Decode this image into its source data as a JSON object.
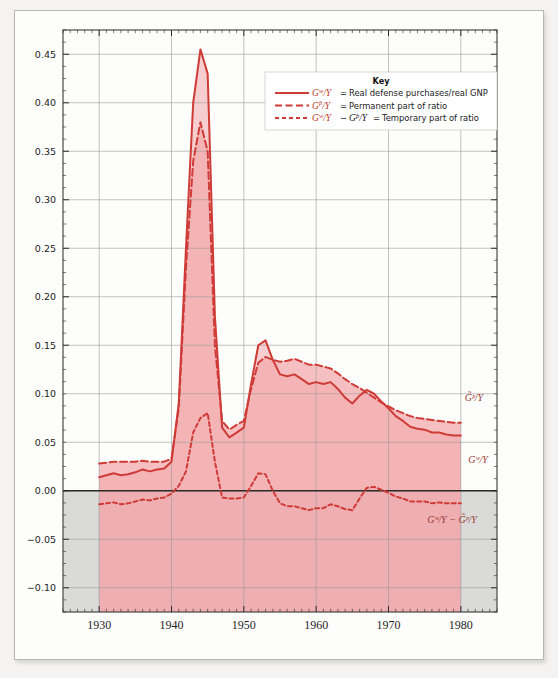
{
  "figure": {
    "background_color": "#f4f3f1",
    "paper_color": "#fdfdfb",
    "accent_color": "#cf3b37",
    "fill_color": "#f2a8ac",
    "negative_band_color": "#d4d4d2"
  },
  "key": {
    "title": "Key",
    "entries": [
      {
        "symbol": "G",
        "sup": "w",
        "denom": "/Y",
        "style": "solid",
        "eq": "=",
        "label": "Real defense purchases/real GNP"
      },
      {
        "symbol": "G",
        "sup": "p",
        "denom": "/Y",
        "style": "dashed",
        "eq": "=",
        "label": "Permanent part of ratio"
      },
      {
        "symbol": "G",
        "sup": "w",
        "denom": "/Y",
        "style": "dotted",
        "eq": "−",
        "symbol2": "G",
        "sup2": "p",
        "denom2": "/Y",
        "eq2": "=",
        "label": "Temporary part of ratio"
      }
    ]
  },
  "annotations": [
    {
      "name": "permanent-curve-label",
      "text": "G̃ᵖ/Y",
      "x": 474,
      "y": 401
    },
    {
      "name": "actual-curve-label",
      "text": "Gʷ/Y",
      "x": 478,
      "y": 463
    },
    {
      "name": "temporary-curve-label",
      "text": "Gʷ/Y − G̃ᵖ/Y",
      "x": 452,
      "y": 523
    }
  ],
  "chart_data": {
    "type": "line",
    "title": "",
    "xlabel": "",
    "ylabel": "",
    "xlim": [
      1925,
      1985
    ],
    "ylim": [
      -0.125,
      0.475
    ],
    "grid": true,
    "legend_position": "upper-right-inset",
    "xticks": [
      1930,
      1940,
      1950,
      1960,
      1970,
      1980
    ],
    "yticks": [
      -0.1,
      -0.05,
      0.0,
      0.05,
      0.1,
      0.15,
      0.2,
      0.25,
      0.3,
      0.35,
      0.4,
      0.45
    ],
    "ytick_labels": [
      "-0.10",
      "-0.05",
      "0.00",
      "0.05",
      "0.10",
      "0.15",
      "0.20",
      "0.25",
      "0.30",
      "0.35",
      "0.40",
      "0.45"
    ],
    "minor_tick_interval": 1,
    "x": [
      1930,
      1931,
      1932,
      1933,
      1934,
      1935,
      1936,
      1937,
      1938,
      1939,
      1940,
      1941,
      1942,
      1943,
      1944,
      1945,
      1946,
      1947,
      1948,
      1949,
      1950,
      1951,
      1952,
      1953,
      1954,
      1955,
      1956,
      1957,
      1958,
      1959,
      1960,
      1961,
      1962,
      1963,
      1964,
      1965,
      1966,
      1967,
      1968,
      1969,
      1970,
      1971,
      1972,
      1973,
      1974,
      1975,
      1976,
      1977,
      1978,
      1979,
      1980
    ],
    "series": [
      {
        "name": "G^w/Y",
        "label": "Real defense purchases/real GNP",
        "style": "solid",
        "values": [
          0.014,
          0.016,
          0.018,
          0.016,
          0.017,
          0.019,
          0.022,
          0.02,
          0.022,
          0.023,
          0.03,
          0.09,
          0.25,
          0.4,
          0.455,
          0.43,
          0.18,
          0.065,
          0.055,
          0.06,
          0.065,
          0.11,
          0.15,
          0.155,
          0.135,
          0.12,
          0.118,
          0.12,
          0.115,
          0.11,
          0.112,
          0.11,
          0.112,
          0.105,
          0.096,
          0.09,
          0.098,
          0.104,
          0.1,
          0.092,
          0.085,
          0.077,
          0.072,
          0.066,
          0.064,
          0.063,
          0.06,
          0.06,
          0.058,
          0.057,
          0.057
        ]
      },
      {
        "name": "G^p/Y",
        "label": "Permanent part of ratio",
        "style": "dashed",
        "values": [
          0.028,
          0.029,
          0.03,
          0.03,
          0.03,
          0.03,
          0.031,
          0.03,
          0.03,
          0.03,
          0.033,
          0.085,
          0.23,
          0.34,
          0.38,
          0.35,
          0.15,
          0.072,
          0.063,
          0.068,
          0.072,
          0.105,
          0.132,
          0.138,
          0.135,
          0.133,
          0.134,
          0.136,
          0.133,
          0.13,
          0.13,
          0.128,
          0.126,
          0.121,
          0.115,
          0.11,
          0.106,
          0.101,
          0.096,
          0.091,
          0.087,
          0.083,
          0.08,
          0.077,
          0.075,
          0.074,
          0.073,
          0.072,
          0.071,
          0.07,
          0.07
        ]
      },
      {
        "name": "G^w/Y - G^p/Y",
        "label": "Temporary part of ratio",
        "style": "dotted",
        "values": [
          -0.014,
          -0.013,
          -0.012,
          -0.014,
          -0.013,
          -0.011,
          -0.009,
          -0.01,
          -0.008,
          -0.007,
          -0.003,
          0.005,
          0.02,
          0.06,
          0.075,
          0.08,
          0.03,
          -0.007,
          -0.008,
          -0.008,
          -0.007,
          0.005,
          0.018,
          0.017,
          0.0,
          -0.013,
          -0.016,
          -0.016,
          -0.018,
          -0.02,
          -0.018,
          -0.018,
          -0.014,
          -0.016,
          -0.019,
          -0.02,
          -0.008,
          0.003,
          0.004,
          0.001,
          -0.002,
          -0.006,
          -0.008,
          -0.011,
          -0.011,
          -0.011,
          -0.013,
          -0.012,
          -0.013,
          -0.013,
          -0.013
        ]
      }
    ]
  }
}
